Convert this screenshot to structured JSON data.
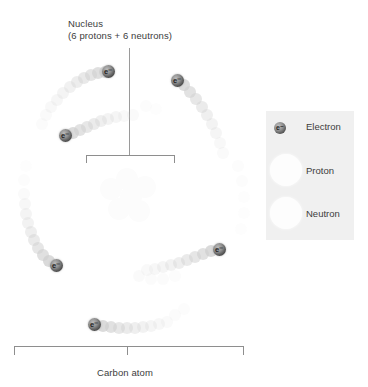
{
  "diagram": {
    "title_faint": "",
    "nucleus_label": {
      "line1": "Nucleus",
      "line2": "(6 protons + 6 neutrons)"
    },
    "bottom_label": "Carbon atom"
  },
  "electrons": {
    "tag": "e⁻",
    "items": [
      {
        "name": "electron-upper-left",
        "x": 101,
        "y": 65,
        "tag": "e⁻"
      },
      {
        "name": "electron-inner-left",
        "x": 59,
        "y": 129,
        "tag": "e⁻"
      },
      {
        "name": "electron-upper-right",
        "x": 171,
        "y": 74,
        "tag": "e⁻"
      },
      {
        "name": "electron-lower-right",
        "x": 213,
        "y": 243,
        "tag": "e⁻"
      },
      {
        "name": "electron-lower-left",
        "x": 50,
        "y": 259,
        "tag": "e⁻"
      },
      {
        "name": "electron-bottom",
        "x": 88,
        "y": 318,
        "tag": "e⁻"
      }
    ]
  },
  "legend": {
    "rows": [
      {
        "key": "electron",
        "label": "Electron"
      },
      {
        "key": "proton",
        "label": "Proton"
      },
      {
        "key": "neutron",
        "label": "Neutron"
      }
    ],
    "background_color": "#f0f0f0"
  },
  "colors": {
    "text": "#3c3c3c",
    "line": "#8e8e8e",
    "electron_dark": "#3a3a3a",
    "trail": "#cfcfcf",
    "particle_white": "#fdfdfd"
  }
}
